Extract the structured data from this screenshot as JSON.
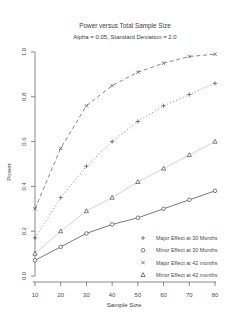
{
  "chart_data": {
    "type": "line",
    "title": "Power versus Total Sample Size",
    "subtitle": "Alpha = 0.05, Standard Deviation = 2.0",
    "xlabel": "Sample Size",
    "ylabel": "Power",
    "x": [
      10,
      20,
      30,
      40,
      50,
      60,
      70,
      80
    ],
    "xlim": [
      10,
      80
    ],
    "ylim": [
      0,
      1
    ],
    "xticks": [
      10,
      20,
      30,
      40,
      50,
      60,
      70,
      80
    ],
    "xtick_labels": [
      "10",
      "20",
      "30",
      "40",
      "50",
      "60",
      "70",
      "80"
    ],
    "yticks": [
      0.0,
      0.2,
      0.4,
      0.6,
      0.8,
      1.0
    ],
    "ytick_labels": [
      "0.0",
      "0.2",
      "0.4",
      "0.6",
      "0.8",
      "1.0"
    ],
    "grid": false,
    "legend_position": "inside-bottom-right",
    "colors": {
      "axis": "#6a6a6a",
      "dark_line": "#555555",
      "light_line": "#c6c6c6",
      "marker": "#5a5a5a",
      "text": "#3d3d3d"
    },
    "series": [
      {
        "name": "Major Effect at 30 Months",
        "marker": "plus",
        "line_style": "dotted",
        "line_color": "#6a6a6a",
        "marker_color": "#5a5a5a",
        "values": [
          0.17,
          0.35,
          0.49,
          0.6,
          0.69,
          0.76,
          0.81,
          0.86
        ]
      },
      {
        "name": "Minor Effect at 30 Months",
        "marker": "circle",
        "line_style": "solid",
        "line_color": "#555555",
        "marker_color": "#5a5a5a",
        "values": [
          0.07,
          0.13,
          0.19,
          0.23,
          0.26,
          0.3,
          0.34,
          0.38
        ]
      },
      {
        "name": "Major Effect at 42 months",
        "marker": "x",
        "line_style": "dashed",
        "line_color": "#6a6a6a",
        "marker_color": "#5a5a5a",
        "values": [
          0.3,
          0.57,
          0.76,
          0.85,
          0.91,
          0.95,
          0.98,
          0.99
        ]
      },
      {
        "name": "Minor Effect at 42 months",
        "marker": "triangle",
        "line_style": "solid",
        "line_color": "#c6c6c6",
        "marker_color": "#5a5a5a",
        "values": [
          0.1,
          0.2,
          0.29,
          0.35,
          0.42,
          0.48,
          0.54,
          0.6
        ]
      }
    ]
  }
}
